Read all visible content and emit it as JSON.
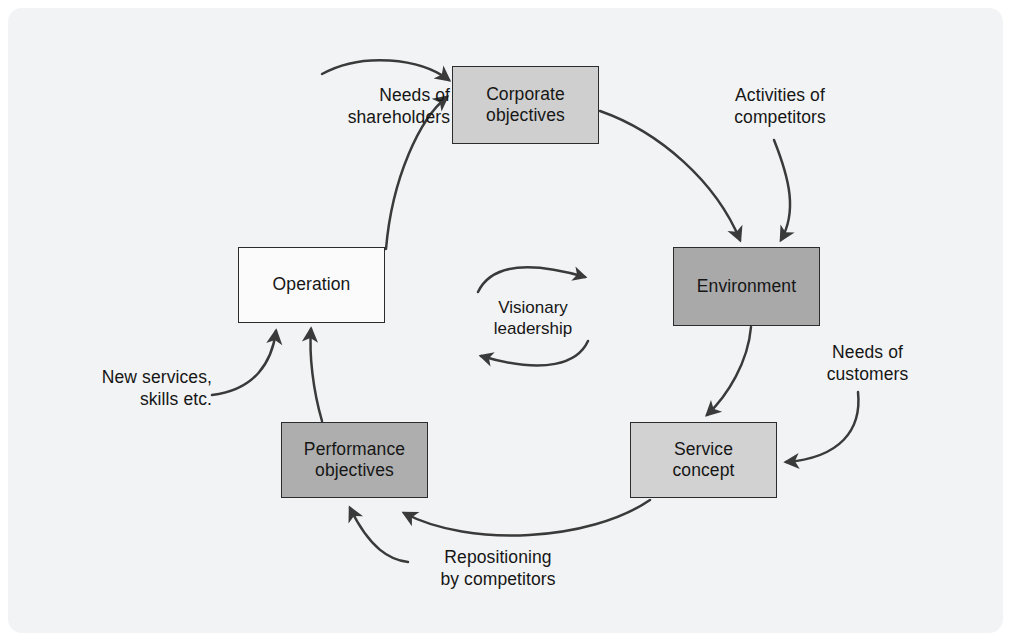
{
  "figure": {
    "background_color": "#f2f3f4",
    "page_color": "#ffffff",
    "line_color": "#3a3a3a",
    "text_color": "#161616"
  },
  "nodes": [
    {
      "id": "corporate-objectives",
      "label": "Corporate\nobjectives",
      "fill": "#cfcfcf",
      "x": 452,
      "y": 66,
      "w": 147,
      "h": 78
    },
    {
      "id": "environment",
      "label": "Environment",
      "fill": "#a9a9a9",
      "x": 673,
      "y": 247,
      "w": 147,
      "h": 79
    },
    {
      "id": "service-concept",
      "label": "Service\nconcept",
      "fill": "#d2d2d2",
      "x": 630,
      "y": 422,
      "w": 147,
      "h": 76
    },
    {
      "id": "performance-objectives",
      "label": "Performance\nobjectives",
      "fill": "#aeaeae",
      "x": 281,
      "y": 422,
      "w": 147,
      "h": 76
    },
    {
      "id": "operation",
      "label": "Operation",
      "fill": "#fbfbfb",
      "x": 238,
      "y": 247,
      "w": 147,
      "h": 76
    }
  ],
  "center": {
    "id": "visionary-leadership",
    "label": "Visionary\nleadership"
  },
  "external_labels": [
    {
      "id": "needs-of-shareholders",
      "label": "Needs of\nshareholders",
      "align": "right"
    },
    {
      "id": "activities-of-competitors",
      "label": "Activities of\ncompetitors",
      "align": "center"
    },
    {
      "id": "needs-of-customers",
      "label": "Needs of\ncustomers",
      "align": "center"
    },
    {
      "id": "repositioning-by-competitors",
      "label": "Repositioning\nby competitors",
      "align": "center"
    },
    {
      "id": "new-services-skills",
      "label": "New services,\nskills etc.",
      "align": "right"
    }
  ],
  "connections": [
    {
      "id": "operation-to-corporate-objectives",
      "from": "operation",
      "to": "corporate-objectives",
      "style": "arc"
    },
    {
      "id": "corporate-objectives-to-environment",
      "from": "corporate-objectives",
      "to": "environment",
      "style": "arc"
    },
    {
      "id": "environment-to-service-concept",
      "from": "environment",
      "to": "service-concept",
      "style": "arc"
    },
    {
      "id": "service-concept-to-performance-objectives",
      "from": "service-concept",
      "to": "performance-objectives",
      "style": "arc"
    },
    {
      "id": "performance-objectives-to-operation",
      "from": "performance-objectives",
      "to": "operation",
      "style": "arc"
    },
    {
      "id": "shareholders-to-corporate-objectives",
      "from": "needs-of-shareholders",
      "to": "corporate-objectives",
      "style": "curve"
    },
    {
      "id": "competitors-to-environment",
      "from": "activities-of-competitors",
      "to": "environment",
      "style": "curve"
    },
    {
      "id": "customers-to-service-concept",
      "from": "needs-of-customers",
      "to": "service-concept",
      "style": "curve"
    },
    {
      "id": "repositioning-to-performance-objectives",
      "from": "repositioning-by-competitors",
      "to": "performance-objectives",
      "style": "curve"
    },
    {
      "id": "new-services-to-operation",
      "from": "new-services-skills",
      "to": "operation",
      "style": "curve"
    },
    {
      "id": "visionary-leadership-clockwise",
      "from": "visionary-leadership",
      "to": "visionary-leadership",
      "style": "rotation"
    }
  ]
}
